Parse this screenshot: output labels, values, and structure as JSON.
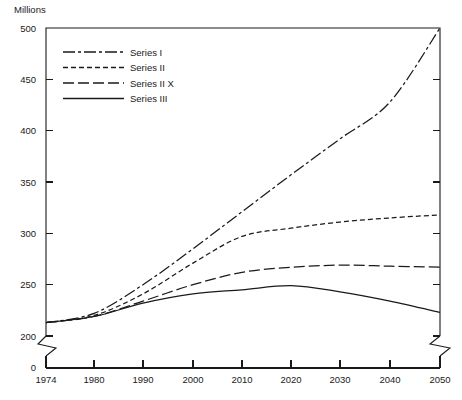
{
  "chart_data": {
    "type": "line",
    "title": "",
    "ylabel": "Millions",
    "xlabel": "",
    "grid": false,
    "legend_position": "top-left-inside",
    "xlim": [
      1974,
      2050
    ],
    "ylim": [
      200,
      500
    ],
    "y_axis_break": true,
    "y_break_label": "0",
    "x": [
      1974,
      1980,
      1990,
      2000,
      2010,
      2020,
      2030,
      2040,
      2050
    ],
    "xtick_labels": [
      "1974",
      "1980",
      "1990",
      "2000",
      "2010",
      "2020",
      "2030",
      "2040",
      "2050"
    ],
    "ytick_labels": [
      "200",
      "250",
      "300",
      "350",
      "400",
      "450",
      "500"
    ],
    "ytick_values": [
      200,
      250,
      300,
      350,
      400,
      450,
      500
    ],
    "series": [
      {
        "name": "Series I",
        "style": "dash-dot",
        "values": [
          213,
          222,
          250,
          285,
          321,
          357,
          392,
          428,
          500
        ]
      },
      {
        "name": "Series II",
        "style": "dashed-short",
        "values": [
          213,
          220,
          241,
          271,
          297,
          305,
          311,
          315,
          318
        ]
      },
      {
        "name": "Series II X",
        "style": "dashed-long",
        "values": [
          213,
          219,
          234,
          250,
          262,
          267,
          269,
          268,
          267
        ]
      },
      {
        "name": "Series III",
        "style": "solid",
        "values": [
          213,
          219,
          232,
          241,
          245,
          249,
          243,
          234,
          223
        ]
      }
    ]
  },
  "axis": {
    "y_title": "Millions",
    "zero_label": "0"
  },
  "legend": {
    "entries": [
      {
        "label": "Series I",
        "style": "dash-dot"
      },
      {
        "label": "Series II",
        "style": "dashed-short"
      },
      {
        "label": "Series II X",
        "style": "dashed-long"
      },
      {
        "label": "Series III",
        "style": "solid"
      }
    ]
  },
  "colors": {
    "ink": "#1a1a1a",
    "background": "#ffffff"
  }
}
